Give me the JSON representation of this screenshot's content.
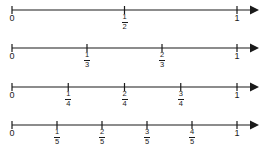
{
  "figure": {
    "background_color": "#ffffff",
    "line_color": "#1a1a1a",
    "text_color": "#1a1a1a"
  },
  "chart_data": {
    "type": "line",
    "xlabel": "",
    "ylabel": "",
    "xlim": [
      0,
      1
    ],
    "grid": false,
    "legend": null,
    "lines": [
      {
        "name": "halves",
        "denominator": 2,
        "start_label": "0",
        "end_label": "1",
        "values": [
          0,
          0.5,
          1
        ],
        "tick_labels": [
          {
            "value": 0,
            "text": "0",
            "type": "whole"
          },
          {
            "value": 0.5,
            "numerator": "1",
            "denominator": "2",
            "type": "fraction"
          },
          {
            "value": 1,
            "text": "1",
            "type": "whole"
          }
        ]
      },
      {
        "name": "thirds",
        "denominator": 3,
        "start_label": "0",
        "end_label": "1",
        "values": [
          0,
          0.3333,
          0.6667,
          1
        ],
        "tick_labels": [
          {
            "value": 0,
            "text": "0",
            "type": "whole"
          },
          {
            "value": 0.3333,
            "numerator": "1",
            "denominator": "3",
            "type": "fraction"
          },
          {
            "value": 0.6667,
            "numerator": "2",
            "denominator": "3",
            "type": "fraction"
          },
          {
            "value": 1,
            "text": "1",
            "type": "whole"
          }
        ]
      },
      {
        "name": "fourths",
        "denominator": 4,
        "start_label": "0",
        "end_label": "1",
        "values": [
          0,
          0.25,
          0.5,
          0.75,
          1
        ],
        "tick_labels": [
          {
            "value": 0,
            "text": "0",
            "type": "whole"
          },
          {
            "value": 0.25,
            "numerator": "1",
            "denominator": "4",
            "type": "fraction"
          },
          {
            "value": 0.5,
            "numerator": "2",
            "denominator": "4",
            "type": "fraction"
          },
          {
            "value": 0.75,
            "numerator": "3",
            "denominator": "4",
            "type": "fraction"
          },
          {
            "value": 1,
            "text": "1",
            "type": "whole"
          }
        ]
      },
      {
        "name": "fifths",
        "denominator": 5,
        "start_label": "0",
        "end_label": "1",
        "values": [
          0,
          0.2,
          0.4,
          0.6,
          0.8,
          1
        ],
        "tick_labels": [
          {
            "value": 0,
            "text": "0",
            "type": "whole"
          },
          {
            "value": 0.2,
            "numerator": "1",
            "denominator": "5",
            "type": "fraction"
          },
          {
            "value": 0.4,
            "numerator": "2",
            "denominator": "5",
            "type": "fraction"
          },
          {
            "value": 0.6,
            "numerator": "3",
            "denominator": "5",
            "type": "fraction"
          },
          {
            "value": 0.8,
            "numerator": "4",
            "denominator": "5",
            "type": "fraction"
          },
          {
            "value": 1,
            "text": "1",
            "type": "whole"
          }
        ]
      }
    ]
  },
  "layout": {
    "row_tops": [
      0,
      38,
      77,
      115
    ],
    "axis_y": 10,
    "x_zero": 12,
    "x_one": 237,
    "arrow_tip_x": 259,
    "tick_half_height": 4
  }
}
